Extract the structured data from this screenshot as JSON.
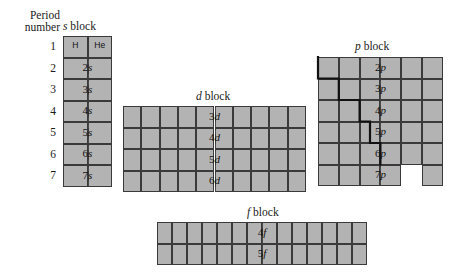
{
  "figure": {
    "period_caption_line1": "Period",
    "period_caption_line2": "number",
    "period_numbers": [
      "1",
      "2",
      "3",
      "4",
      "5",
      "6",
      "7"
    ]
  },
  "blocks": {
    "s": {
      "title_letter": "s",
      "title_word": "block",
      "columns": 2,
      "rows": 7,
      "element_symbols": [
        "H",
        "He"
      ],
      "row_labels": [
        "",
        "2s",
        "3s",
        "4s",
        "5s",
        "6s",
        "7s"
      ],
      "row_label_numbers": [
        "",
        "2",
        "3",
        "4",
        "5",
        "6",
        "7"
      ],
      "row_label_letters": [
        "",
        "s",
        "s",
        "s",
        "s",
        "s",
        "s"
      ]
    },
    "d": {
      "title_letter": "d",
      "title_word": "block",
      "columns": 10,
      "rows": 4,
      "row_labels": [
        "3d",
        "4d",
        "5d",
        "6d"
      ],
      "row_label_numbers": [
        "3",
        "4",
        "5",
        "6"
      ],
      "row_label_letters": [
        "d",
        "d",
        "d",
        "d"
      ],
      "start_period": 4
    },
    "p": {
      "title_letter": "p",
      "title_word": "block",
      "columns": 6,
      "rows": 6,
      "row_labels": [
        "2p",
        "3p",
        "4p",
        "5p",
        "6p",
        "7p"
      ],
      "row_label_numbers": [
        "2",
        "3",
        "4",
        "5",
        "6",
        "7"
      ],
      "row_label_letters": [
        "p",
        "p",
        "p",
        "p",
        "p",
        "p"
      ],
      "start_period": 2,
      "missing_cells": [
        {
          "row": 5,
          "col": 4
        }
      ]
    },
    "f": {
      "title_letter": "f",
      "title_word": "block",
      "columns": 14,
      "rows": 2,
      "row_labels": [
        "4f",
        "5f"
      ],
      "row_label_numbers": [
        "4",
        "5"
      ],
      "row_label_letters": [
        "f",
        "f"
      ]
    }
  },
  "colors": {
    "cell_fill": "#b3b3b3",
    "cell_border": "#3a3a3a",
    "stair_line": "#111111",
    "background": "#ffffff",
    "text": "#1a1a1a"
  }
}
